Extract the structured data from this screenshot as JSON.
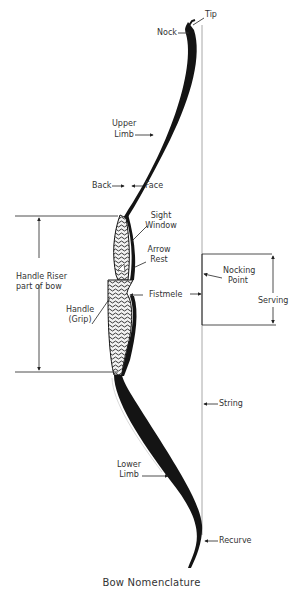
{
  "diagram": {
    "title": "Bow Nomenclature",
    "labels": {
      "tip": "Tip",
      "nock": "Nock",
      "upper_limb_1": "Upper",
      "upper_limb_2": "Limb",
      "back": "Back",
      "face": "Face",
      "sight_window_1": "Sight",
      "sight_window_2": "Window",
      "arrow_rest_1": "Arrow",
      "arrow_rest_2": "Rest",
      "handle_riser_1": "Handle Riser",
      "handle_riser_2": "part of bow",
      "nocking_point_1": "Nocking",
      "nocking_point_2": "Point",
      "fistmele": "Fistmele",
      "handle_1": "Handle",
      "handle_2": "(Grip)",
      "serving": "Serving",
      "string": "String",
      "lower_limb_1": "Lower",
      "lower_limb_2": "Limb",
      "recurve": "Recurve"
    },
    "colors": {
      "ink": "#1a1a1a",
      "string": "#9a9a9a",
      "background": "#ffffff"
    }
  }
}
